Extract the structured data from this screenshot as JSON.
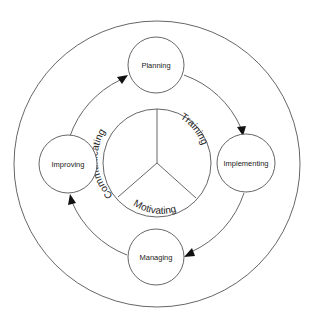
{
  "diagram": {
    "type": "cycle",
    "cycle_nodes": [
      {
        "id": "planning",
        "label": "Planning"
      },
      {
        "id": "implementing",
        "label": "Implementing"
      },
      {
        "id": "managing",
        "label": "Managing"
      },
      {
        "id": "improving",
        "label": "Improving"
      }
    ],
    "cycle_edges": [
      {
        "from": "planning",
        "to": "implementing"
      },
      {
        "from": "implementing",
        "to": "managing"
      },
      {
        "from": "managing",
        "to": "improving"
      },
      {
        "from": "improving",
        "to": "planning"
      }
    ],
    "center_segments": [
      {
        "id": "communicating",
        "label": "Communicating"
      },
      {
        "id": "training",
        "label": "Training"
      },
      {
        "id": "motivating",
        "label": "Motivating"
      }
    ],
    "colors": {
      "stroke": "#555555",
      "arrowhead": "#111111",
      "text": "#222222",
      "background": "#ffffff"
    }
  }
}
